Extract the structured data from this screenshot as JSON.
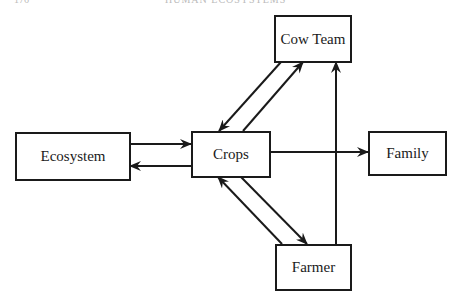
{
  "page_header": {
    "left": "176",
    "center": "HUMAN ECOSYSTEMS"
  },
  "nodes": {
    "cow_team": "Cow Team",
    "ecosystem": "Ecosystem",
    "crops": "Crops",
    "family": "Family",
    "farmer": "Farmer"
  },
  "edges": [
    {
      "from": "Ecosystem",
      "to": "Crops"
    },
    {
      "from": "Crops",
      "to": "Ecosystem"
    },
    {
      "from": "Crops",
      "to": "Family"
    },
    {
      "from": "Crops",
      "to": "Cow Team"
    },
    {
      "from": "Cow Team",
      "to": "Crops"
    },
    {
      "from": "Crops",
      "to": "Farmer"
    },
    {
      "from": "Farmer",
      "to": "Crops"
    },
    {
      "from": "Farmer",
      "to": "Cow Team"
    }
  ],
  "colors": {
    "stroke": "#1a1a1a",
    "background": "#ffffff"
  }
}
